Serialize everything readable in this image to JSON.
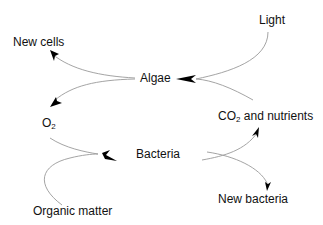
{
  "diagram": {
    "type": "cycle",
    "title": "",
    "nodes": [
      {
        "id": "light",
        "label": "Light"
      },
      {
        "id": "new_cells",
        "label": "New cells"
      },
      {
        "id": "algae",
        "label": "Algae"
      },
      {
        "id": "o2",
        "label": "O",
        "sub": "2"
      },
      {
        "id": "co2",
        "label": "CO",
        "sub": "2",
        "suffix": " and nutrients"
      },
      {
        "id": "bacteria",
        "label": "Bacteria"
      },
      {
        "id": "organic_matter",
        "label": "Organic matter"
      },
      {
        "id": "new_bacteria",
        "label": "New bacteria"
      }
    ],
    "edges": [
      {
        "from": "light",
        "to": "algae"
      },
      {
        "from": "co2",
        "to": "algae"
      },
      {
        "from": "algae",
        "to": "new_cells"
      },
      {
        "from": "algae",
        "to": "o2"
      },
      {
        "from": "o2",
        "to": "bacteria"
      },
      {
        "from": "organic_matter",
        "to": "bacteria"
      },
      {
        "from": "bacteria",
        "to": "co2"
      },
      {
        "from": "bacteria",
        "to": "new_bacteria"
      }
    ],
    "colors": {
      "line": "#9a9a9a",
      "arrowhead": "#000000",
      "text": "#111111",
      "background": "#ffffff"
    }
  }
}
